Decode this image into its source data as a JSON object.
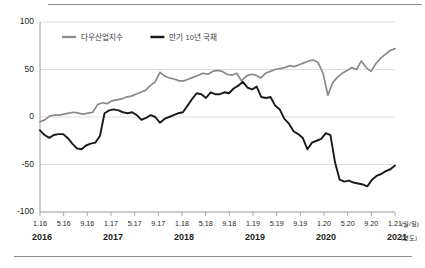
{
  "figure": {
    "has_top_rule": true,
    "has_bottom_rule": true,
    "rule_color": "#8c8c8c"
  },
  "chart_data": {
    "type": "line",
    "title": "",
    "subtitle": "",
    "xlabel": "",
    "ylabel": "",
    "xunit_label": "(월/일)",
    "yearunit_label": "(연도)",
    "ylim": [
      -100,
      100
    ],
    "yticks": [
      100,
      50,
      0,
      -50,
      -100
    ],
    "ytick_labels": [
      "100",
      "50",
      "0",
      "-50",
      "-100"
    ],
    "grid": true,
    "legend_position": "top-left-inside",
    "xtick_labels": [
      "1.16",
      "5.16",
      "9.16",
      "1.17",
      "5.17",
      "9.17",
      "1.18",
      "5.18",
      "9.18",
      "1.19",
      "5.19",
      "9.19",
      "1.20",
      "5.20",
      "9.20",
      "1.21"
    ],
    "xtick_positions": [
      0,
      4,
      8,
      12,
      16,
      20,
      24,
      28,
      32,
      36,
      40,
      44,
      48,
      52,
      56,
      60
    ],
    "year_labels": [
      "2016",
      "2017",
      "2018",
      "2019",
      "2020",
      "2021"
    ],
    "year_positions": [
      0,
      12,
      24,
      36,
      48,
      60
    ],
    "x_count": 61,
    "series": [
      {
        "name": "다우산업지수",
        "color": "#8a8a8a",
        "width": 1.7,
        "values": [
          -5,
          -3,
          1,
          2,
          2,
          3,
          4,
          5,
          4,
          3,
          4,
          5,
          13,
          15,
          14,
          17,
          18,
          19,
          21,
          22,
          24,
          26,
          28,
          33,
          37,
          47,
          43,
          41,
          40,
          38,
          38,
          40,
          42,
          44,
          46,
          45,
          48,
          49,
          48,
          45,
          44,
          46,
          38,
          43,
          45,
          44,
          41,
          46,
          48,
          50,
          51,
          52,
          54,
          53,
          55,
          57,
          59,
          60,
          57,
          46,
          23,
          36,
          42,
          46,
          49,
          52,
          50,
          59,
          52,
          48,
          56,
          62,
          66,
          70,
          72
        ]
      },
      {
        "name": "만기 10년 국채",
        "color": "#1a1a1a",
        "width": 1.9,
        "values": [
          -14,
          -19,
          -22,
          -19,
          -18,
          -18,
          -22,
          -28,
          -33,
          -34,
          -30,
          -28,
          -27,
          -20,
          4,
          7,
          8,
          7,
          5,
          4,
          5,
          2,
          -3,
          -1,
          2,
          0,
          -6,
          -2,
          0,
          2,
          4,
          5,
          12,
          19,
          25,
          24,
          20,
          26,
          24,
          24,
          26,
          25,
          30,
          33,
          37,
          31,
          29,
          32,
          21,
          20,
          21,
          12,
          8,
          -2,
          -7,
          -15,
          -18,
          -22,
          -34,
          -27,
          -25,
          -23,
          -17,
          -19,
          -48,
          -66,
          -68,
          -67,
          -69,
          -70,
          -71,
          -73,
          -66,
          -62,
          -60,
          -57,
          -55,
          -51
        ]
      }
    ]
  }
}
